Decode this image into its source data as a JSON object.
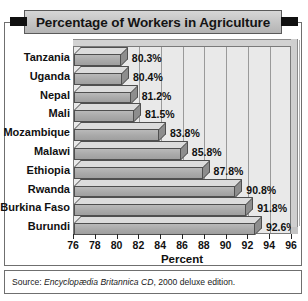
{
  "chart_data": {
    "type": "bar",
    "orientation": "horizontal",
    "title": "Percentage of Workers in Agriculture",
    "xlabel": "Percent",
    "ylabel": "",
    "xlim": [
      76,
      96
    ],
    "xticks": [
      76,
      78,
      80,
      82,
      84,
      86,
      88,
      90,
      92,
      94,
      96
    ],
    "grid": true,
    "legend": null,
    "categories": [
      "Tanzania",
      "Uganda",
      "Nepal",
      "Mali",
      "Mozambique",
      "Malawi",
      "Ethiopia",
      "Rwanda",
      "Burkina Faso",
      "Burundi"
    ],
    "values": [
      80.3,
      80.4,
      81.2,
      81.5,
      83.8,
      85.8,
      87.8,
      90.8,
      91.8,
      92.6
    ],
    "data_labels": [
      "80.3%",
      "80.4%",
      "81.2%",
      "81.5%",
      "83.8%",
      "85.8%",
      "87.8%",
      "90.8%",
      "91.8%",
      "92.6%"
    ]
  },
  "source": {
    "prefix": "Source: ",
    "italic": "Encyclopædia Britannica CD",
    "suffix": ", 2000 deluxe edition."
  },
  "colors": {
    "bar_face": "#a9a9a9",
    "bar_top": "#dcdcdc",
    "bar_side": "#8d8d8d",
    "plot_background": "#e9e9e9",
    "banner": "#c6c6c6",
    "frame": "#6f6f6f",
    "text": "#111111"
  }
}
